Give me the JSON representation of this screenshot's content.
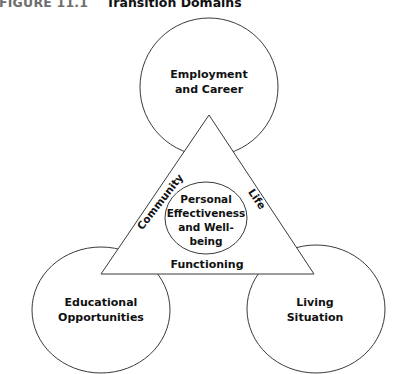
{
  "figure": {
    "number": "FIGURE 11.1",
    "title": "Transition Domains"
  },
  "colors": {
    "stroke": "#3a3a3a",
    "text": "#111111",
    "figure_number": "#6e6e6e",
    "background": "#ffffff"
  },
  "diagram": {
    "top_circle": {
      "line1": "Employment",
      "line2": "and Career"
    },
    "left_circle": {
      "line1": "Educational",
      "line2": "Opportunities"
    },
    "right_circle": {
      "line1": "Living",
      "line2": "Situation"
    },
    "center_circle": {
      "line1": "Personal",
      "line2": "Effectiveness",
      "line3": "and Well-",
      "line4": "being"
    },
    "triangle_labels": {
      "left_edge": "Community",
      "right_edge": "Life",
      "bottom_edge": "Functioning"
    }
  }
}
